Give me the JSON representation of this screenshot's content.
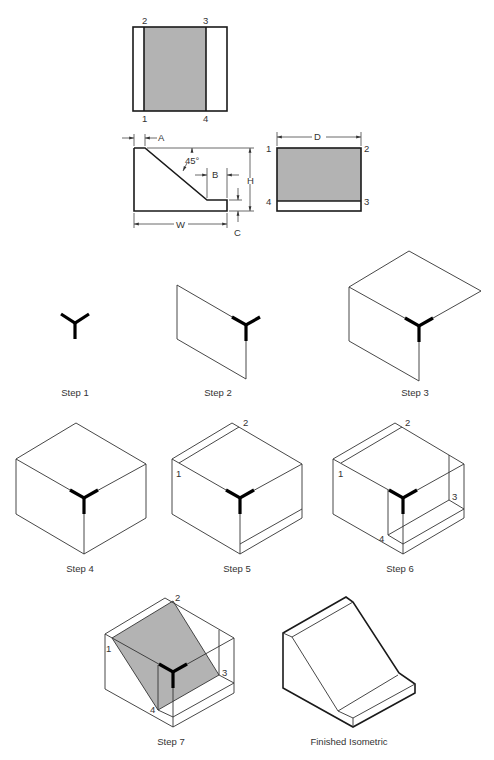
{
  "colors": {
    "shade": "#b3b3b3",
    "line": "#333333",
    "axis": "#000000"
  },
  "orthographic": {
    "top_view": {
      "labels": [
        "2",
        "3",
        "1",
        "4"
      ]
    },
    "front_view": {
      "dims": {
        "a": "A",
        "b": "B",
        "h": "H",
        "w": "W",
        "c": "C",
        "angle": "45°"
      }
    },
    "side_view": {
      "dim_d": "D",
      "labels": [
        "1",
        "2",
        "4",
        "3"
      ]
    }
  },
  "steps": [
    {
      "label": "Step 1"
    },
    {
      "label": "Step 2"
    },
    {
      "label": "Step 3"
    },
    {
      "label": "Step 4"
    },
    {
      "label": "Step 5",
      "points": [
        "1",
        "2"
      ]
    },
    {
      "label": "Step 6",
      "points": [
        "1",
        "2",
        "3",
        "4"
      ]
    },
    {
      "label": "Step 7",
      "points": [
        "1",
        "2",
        "3",
        "4"
      ]
    },
    {
      "label": "Finished Isometric"
    }
  ]
}
